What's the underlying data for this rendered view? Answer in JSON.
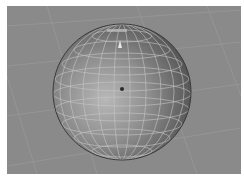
{
  "viewport": {
    "label": "3D viewport",
    "background_color": "#8a8a8a",
    "grid_color": "#9a9a9a",
    "object": {
      "type": "sphere",
      "wire_color": "#c8c8c8",
      "shade_light": "#b4b4b4",
      "shade_dark": "#4a4a4a",
      "pivot_color": "#2a2a2a"
    }
  }
}
